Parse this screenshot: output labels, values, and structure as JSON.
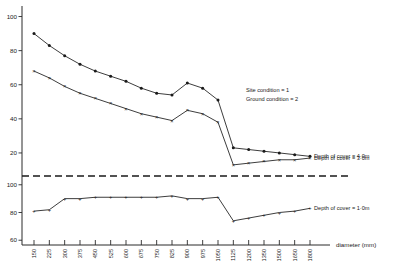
{
  "chart_data": {
    "type": "line",
    "title": "",
    "xlabel": "diameter (mm)",
    "ylabel": "",
    "grid": false,
    "legend_position": "right",
    "annotations": [
      "Site condition = 1",
      "Ground condition = 2"
    ],
    "axis_note": "broken y-axis: upper panel ticks 100/80/60/40/20, lower panel ticks 100/80/60, separated by dashed break line",
    "categories": [
      150,
      225,
      300,
      375,
      450,
      525,
      600,
      675,
      750,
      825,
      900,
      975,
      1050,
      1125,
      1200,
      1350,
      1500,
      1650,
      1800
    ],
    "xtick_labels": [
      "150",
      "225",
      "300",
      "375",
      "450",
      "525",
      "600",
      "675",
      "750",
      "825",
      "900",
      "975",
      "1050",
      "1125",
      "1200",
      "1350",
      "1500",
      "1650",
      "1800"
    ],
    "upper_panel": {
      "ytick_labels": [
        "100",
        "80",
        "60",
        "40",
        "20"
      ],
      "ytick_values": [
        100,
        80,
        60,
        40,
        20
      ],
      "ylim": [
        10,
        105
      ]
    },
    "lower_panel": {
      "ytick_labels": [
        "100",
        "80",
        "60"
      ],
      "ytick_values": [
        100,
        80,
        60
      ],
      "ylim": [
        58,
        102
      ]
    },
    "series": [
      {
        "name": "Depth of cover = 4·0m",
        "marker": "filled-circle",
        "panel": "upper",
        "values": [
          90,
          83,
          77,
          72,
          68,
          65,
          62,
          58,
          55,
          54,
          61,
          58,
          51,
          23,
          22,
          21,
          20,
          19,
          18
        ]
      },
      {
        "name": "Depth of cover = 3·0m",
        "marker": "cross-x",
        "panel": "upper",
        "values": [
          68,
          64,
          59,
          55,
          52,
          49,
          46,
          43,
          41,
          39,
          45,
          43,
          38,
          13,
          14,
          15,
          16,
          16,
          17
        ]
      },
      {
        "name": "Depth of cover = 1·0m",
        "marker": "plus",
        "panel": "lower",
        "values": [
          81,
          82,
          90,
          90,
          91,
          91,
          91,
          91,
          91,
          92,
          90,
          90,
          91,
          74,
          76,
          78,
          80,
          81,
          83
        ]
      }
    ],
    "legend": [
      {
        "label": "Depth of cover = 4·0m",
        "marker": "filled-circle"
      },
      {
        "label": "Depth of cover = 3·0m",
        "marker": "cross-x"
      },
      {
        "label": "Depth of cover = 1·0m",
        "marker": "plus"
      }
    ],
    "colors": {
      "line": "#1a1a1a",
      "axis": "#2a2a2a",
      "background": "#ffffff"
    }
  }
}
